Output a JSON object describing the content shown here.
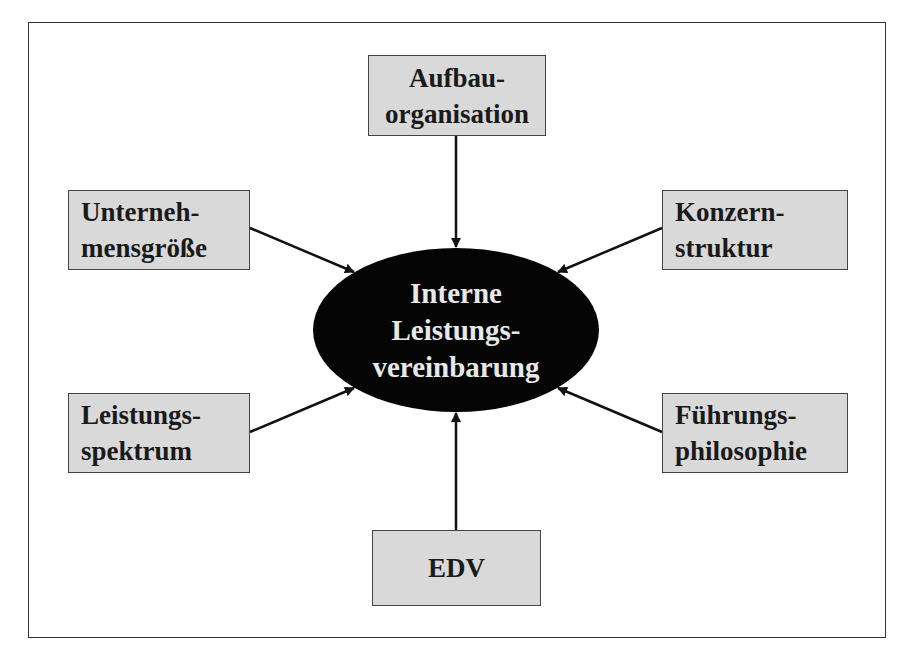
{
  "diagram": {
    "center": {
      "lines": [
        "Interne",
        "Leistungs-",
        "vereinbarung"
      ],
      "fill": "#050505",
      "text_color": "#e8e8e8"
    },
    "factors": [
      {
        "id": "aufbauorganisation",
        "lines": [
          "Aufbau-",
          "organisation"
        ],
        "position": "top"
      },
      {
        "id": "unternehmensgroesse",
        "lines": [
          "Unterneh-",
          "mensgröße"
        ],
        "position": "upper-left"
      },
      {
        "id": "konzernstruktur",
        "lines": [
          "Konzern-",
          "struktur"
        ],
        "position": "upper-right"
      },
      {
        "id": "leistungsspektrum",
        "lines": [
          "Leistungs-",
          "spektrum"
        ],
        "position": "lower-left"
      },
      {
        "id": "fuehrungsphilosophie",
        "lines": [
          "Führungs-",
          "philosophie"
        ],
        "position": "lower-right"
      },
      {
        "id": "edv",
        "lines": [
          "EDV"
        ],
        "position": "bottom"
      }
    ],
    "box_fill": "#d9d9d9",
    "arrow_color": "#111111",
    "arrows": "all factors point toward center"
  }
}
